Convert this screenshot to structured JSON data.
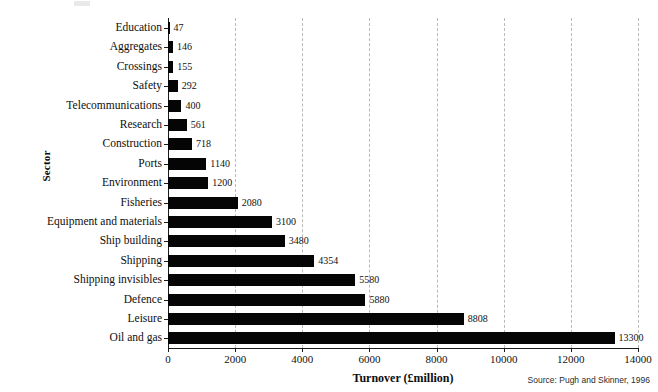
{
  "chart_data": {
    "type": "bar",
    "orientation": "horizontal",
    "title": "",
    "xlabel": "Turnover (£million)",
    "ylabel": "Sector",
    "xlim": [
      0,
      14000
    ],
    "xticks": [
      "0",
      "2000",
      "4000",
      "6000",
      "8000",
      "10000",
      "12000",
      "14000"
    ],
    "xtick_values": [
      0,
      2000,
      4000,
      6000,
      8000,
      10000,
      12000,
      14000
    ],
    "grid": "vertical-dashed",
    "legend": "none",
    "source_note": "Source: Pugh and Skinner, 1996",
    "categories": [
      "Education",
      "Aggregates",
      "Crossings",
      "Safety",
      "Telecommunications",
      "Research",
      "Construction",
      "Ports",
      "Environment",
      "Fisheries",
      "Equipment and materials",
      "Ship building",
      "Shipping",
      "Shipping invisibles",
      "Defence",
      "Leisure",
      "Oil and gas"
    ],
    "values": [
      47,
      146,
      155,
      292,
      400,
      561,
      718,
      1140,
      1200,
      2080,
      3100,
      3480,
      4354,
      5580,
      5880,
      8808,
      13300
    ],
    "value_labels": [
      "47",
      "146",
      "155",
      "292",
      "400",
      "561",
      "718",
      "1140",
      "1200",
      "2080",
      "3100",
      "3480",
      "4354",
      "5580",
      "5880",
      "8808",
      "13300"
    ],
    "bar_color": "#050505",
    "grid_color": "#b9b9b9",
    "axis_color": "#1a1a1a"
  }
}
